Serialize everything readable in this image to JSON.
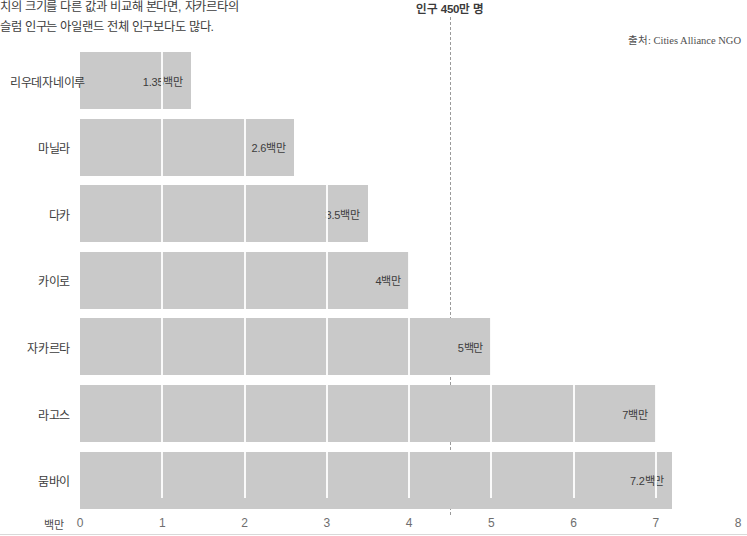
{
  "caption": {
    "lines": [
      "치의 크기를 다른 값과 비교해 본다면, 자카르타의",
      "슬럼 인구는 아일랜드 전체 인구보다도 많다."
    ]
  },
  "annotation": {
    "threshold_label": "인구 450만 명",
    "threshold_value": 4.5
  },
  "source": {
    "text": "출처: Cities Alliance NGO"
  },
  "axis": {
    "unit_label": "백만",
    "ticks": [
      "0",
      "1",
      "2",
      "3",
      "4",
      "5",
      "6",
      "7",
      "8"
    ]
  },
  "colors": {
    "bar": "#c9c9c9",
    "text": "#3c3c3c",
    "tick": "#6e6e6e",
    "dashed_line": "#9a9a9a"
  },
  "chart_data": {
    "type": "bar",
    "orientation": "horizontal",
    "title": "",
    "subtitle": "",
    "xlabel": "백만",
    "ylabel": "",
    "xlim": [
      0,
      8
    ],
    "grid": true,
    "legend": null,
    "categories": [
      "리우데자네이루",
      "마닐라",
      "다카",
      "카이로",
      "자카르타",
      "라고스",
      "뭄바이"
    ],
    "values": [
      1.35,
      2.6,
      3.5,
      4,
      5,
      7,
      7.2
    ],
    "value_labels": [
      "1.35백만",
      "2.6백만",
      "3.5백만",
      "4백만",
      "5백만",
      "7백만",
      "7.2백만"
    ],
    "annotations": [
      {
        "type": "vline",
        "value": 4.5,
        "label": "인구 450만 명",
        "style": "dashed"
      }
    ],
    "source": "출처: Cities Alliance NGO"
  }
}
